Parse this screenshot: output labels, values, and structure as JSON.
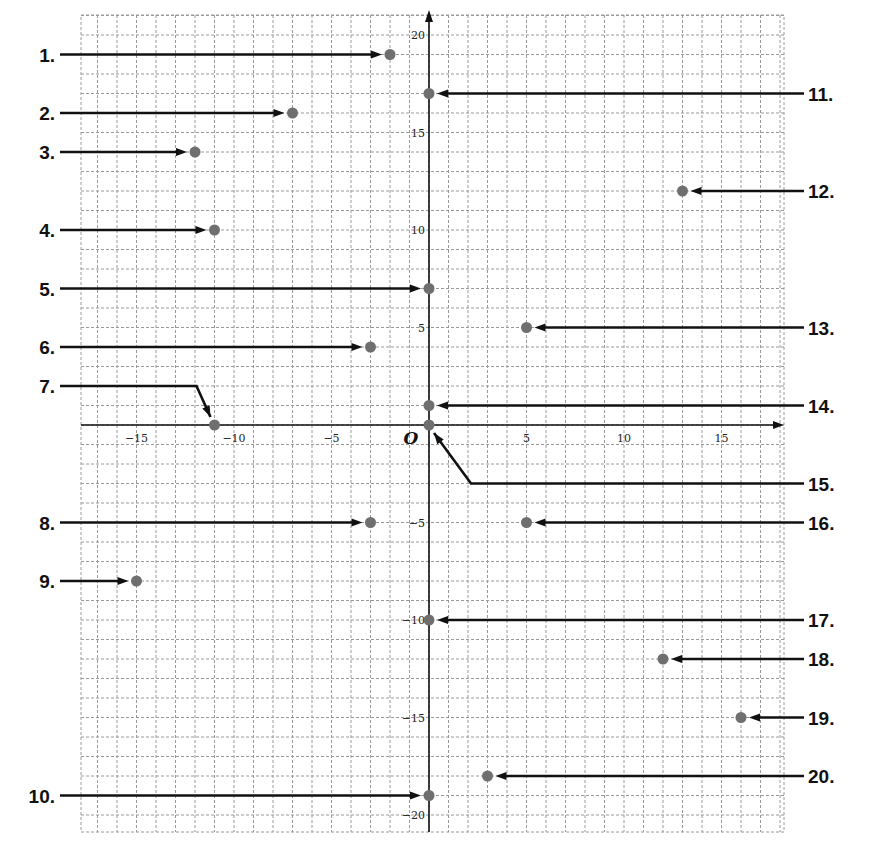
{
  "diagram": {
    "title": "",
    "coordinate_plane": {
      "x_range": [
        -18,
        18
      ],
      "y_range": [
        -21,
        21
      ],
      "grid_step": 1,
      "origin_label": "O",
      "x_tick_labels": [
        {
          "value": -15,
          "text": "−15"
        },
        {
          "value": -10,
          "text": "−10"
        },
        {
          "value": -5,
          "text": "−5"
        },
        {
          "value": 5,
          "text": "5"
        },
        {
          "value": 10,
          "text": "10"
        },
        {
          "value": 15,
          "text": "15"
        }
      ],
      "y_tick_labels": [
        {
          "value": 20,
          "text": "20"
        },
        {
          "value": 15,
          "text": "15"
        },
        {
          "value": 10,
          "text": "10"
        },
        {
          "value": 5,
          "text": "5"
        },
        {
          "value": -5,
          "text": "−5"
        },
        {
          "value": -10,
          "text": "−10"
        },
        {
          "value": -15,
          "text": "−15"
        },
        {
          "value": -20,
          "text": "−20"
        }
      ]
    },
    "colors": {
      "point": "#6f6f6f",
      "grid": "#9a9a9a",
      "axis": "#111111",
      "pointer": "#111111"
    },
    "problems": [
      {
        "label": "1.",
        "x": -2,
        "y": 19,
        "side": "left"
      },
      {
        "label": "2.",
        "x": -7,
        "y": 16,
        "side": "left"
      },
      {
        "label": "3.",
        "x": -12,
        "y": 14,
        "side": "left"
      },
      {
        "label": "4.",
        "x": -11,
        "y": 10,
        "side": "left"
      },
      {
        "label": "5.",
        "x": 0,
        "y": 7,
        "side": "left"
      },
      {
        "label": "6.",
        "x": -3,
        "y": 4,
        "side": "left"
      },
      {
        "label": "7.",
        "x": -11,
        "y": 0,
        "side": "left",
        "bent": true,
        "label_y": 2
      },
      {
        "label": "8.",
        "x": -3,
        "y": -5,
        "side": "left"
      },
      {
        "label": "9.",
        "x": -15,
        "y": -8,
        "side": "left"
      },
      {
        "label": "10.",
        "x": 0,
        "y": -19,
        "side": "left"
      },
      {
        "label": "11.",
        "x": 0,
        "y": 17,
        "side": "right"
      },
      {
        "label": "12.",
        "x": 13,
        "y": 12,
        "side": "right"
      },
      {
        "label": "13.",
        "x": 5,
        "y": 5,
        "side": "right"
      },
      {
        "label": "14.",
        "x": 0,
        "y": 1,
        "side": "right"
      },
      {
        "label": "15.",
        "x": 0,
        "y": 0,
        "side": "right",
        "bent": true,
        "label_y": -3
      },
      {
        "label": "16.",
        "x": 5,
        "y": -5,
        "side": "right"
      },
      {
        "label": "17.",
        "x": 0,
        "y": -10,
        "side": "right"
      },
      {
        "label": "18.",
        "x": 12,
        "y": -12,
        "side": "right"
      },
      {
        "label": "19.",
        "x": 16,
        "y": -15,
        "side": "right"
      },
      {
        "label": "20.",
        "x": 3,
        "y": -18,
        "side": "right"
      }
    ]
  }
}
